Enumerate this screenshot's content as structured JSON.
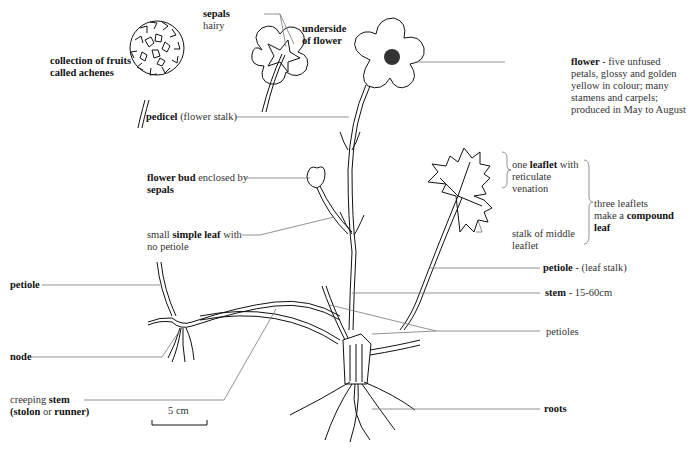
{
  "diagram": {
    "labels": {
      "achenes": {
        "bold": "collection of fruits",
        "line2_bold": "called achenes"
      },
      "sepals": {
        "bold": "sepals",
        "rest": "hairy"
      },
      "underside": {
        "line1": "underside",
        "line2": "of flower"
      },
      "flower": {
        "bold": "flower",
        "rest": " - five unfused",
        "lines": [
          "petals, glossy and golden",
          "yellow in colour; many",
          "stamens and carpels;",
          "produced in May to August"
        ]
      },
      "pedicel": {
        "bold": "pedicel",
        "rest": " (flower stalk)"
      },
      "bud": {
        "bold": "flower bud",
        "rest": " enclosed by",
        "line2_bold": "sepals"
      },
      "simple_leaf": {
        "pre": "small ",
        "bold": "simple leaf",
        "rest": " with",
        "line2": "no petiole"
      },
      "leaflet": {
        "pre": "one ",
        "bold": "leaflet",
        "rest": " with",
        "line2": "reticulate",
        "line3": "venation"
      },
      "compound": {
        "line1": "three leaflets",
        "pre": "make a ",
        "bold": "compound",
        "line3_bold": "leaf"
      },
      "stalk_middle": {
        "line1": "stalk of middle",
        "line2": "leaflet"
      },
      "petiole_right": {
        "bold": "petiole",
        "rest": " - (leaf stalk)"
      },
      "stem": {
        "bold": "stem",
        "rest": " - 15-60cm"
      },
      "petioles": {
        "text": "petioles"
      },
      "roots": {
        "bold": "roots"
      },
      "petiole_left": {
        "bold": "petiole"
      },
      "node": {
        "bold": "node"
      },
      "creeping": {
        "pre": "creeping ",
        "bold": "stem",
        "paren_open": "(",
        "bold2": "stolon",
        "mid": " or ",
        "bold3": "runner",
        "paren_close": ")"
      },
      "scale": {
        "text": "5 cm"
      }
    }
  }
}
